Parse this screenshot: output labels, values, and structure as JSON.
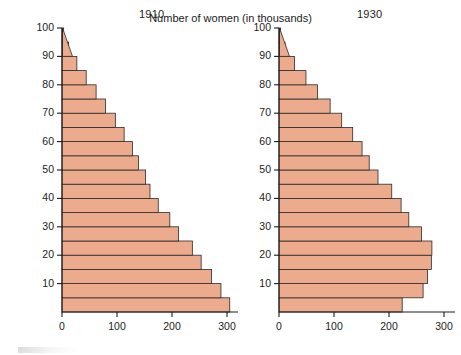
{
  "figure": {
    "x_axis_title": "Number of women (in thousands)",
    "y_axis_title": "Age"
  },
  "panels": [
    {
      "title": "1910"
    },
    {
      "title": "1930"
    }
  ],
  "chart_data": [
    {
      "type": "bar",
      "title": "1910",
      "orientation": "horizontal",
      "xlabel": "Number of women (in thousands)",
      "ylabel": "Age",
      "xlim": [
        0,
        320
      ],
      "ylim": [
        0,
        100
      ],
      "grid": false,
      "legend": null,
      "xticks": [
        0,
        100,
        200,
        300
      ],
      "yticks": [
        10,
        20,
        30,
        40,
        50,
        60,
        70,
        80,
        90,
        100
      ],
      "categories": [
        "0-5",
        "5-10",
        "10-15",
        "15-20",
        "20-25",
        "25-30",
        "30-35",
        "35-40",
        "40-45",
        "45-50",
        "50-55",
        "55-60",
        "60-65",
        "65-70",
        "70-75",
        "75-80",
        "80-85",
        "85-90",
        "90-95",
        "95-100"
      ],
      "values": [
        305,
        289,
        272,
        253,
        237,
        212,
        196,
        175,
        160,
        152,
        139,
        128,
        113,
        97,
        79,
        62,
        44,
        27,
        12,
        3
      ]
    },
    {
      "type": "bar",
      "title": "1930",
      "orientation": "horizontal",
      "xlabel": "Number of women (in thousands)",
      "ylabel": "Age",
      "xlim": [
        0,
        320
      ],
      "ylim": [
        0,
        100
      ],
      "grid": false,
      "legend": null,
      "xticks": [
        0,
        100,
        200,
        300
      ],
      "yticks": [
        10,
        20,
        30,
        40,
        50,
        60,
        70,
        80,
        90,
        100
      ],
      "categories": [
        "0-5",
        "5-10",
        "10-15",
        "15-20",
        "20-25",
        "25-30",
        "30-35",
        "35-40",
        "40-45",
        "45-50",
        "50-55",
        "55-60",
        "60-65",
        "65-70",
        "70-75",
        "75-80",
        "80-85",
        "85-90",
        "90-95",
        "95-100"
      ],
      "values": [
        224,
        262,
        270,
        277,
        278,
        259,
        236,
        222,
        205,
        180,
        164,
        151,
        134,
        114,
        93,
        70,
        49,
        28,
        11,
        3
      ]
    }
  ]
}
